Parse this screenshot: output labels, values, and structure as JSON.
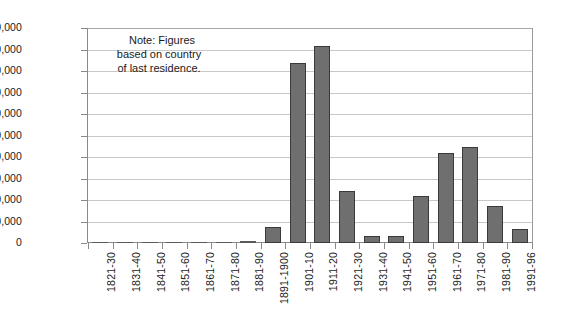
{
  "chart_data": {
    "type": "bar",
    "title": "",
    "subtitle": "",
    "xlabel": "",
    "ylabel": "",
    "ylim": [
      0,
      200000
    ],
    "ytick_step": 20000,
    "grid": true,
    "legend": false,
    "annotations": [
      "Note: Figures",
      "based on country",
      "of last residence."
    ],
    "ytick_labels": [
      "200,000",
      "180,000",
      "160,000",
      "140,000",
      "120,000",
      "100,000",
      "80,000",
      "60,000",
      "40,000",
      "20,000",
      "0"
    ],
    "categories": [
      "1821-30",
      "1831-40",
      "1841-50",
      "1851-60",
      "1861-70",
      "1871-80",
      "1881-90",
      "1891-1900",
      "1901-10",
      "1911-20",
      "1921-30",
      "1931-40",
      "1941-50",
      "1951-60",
      "1961-70",
      "1971-80",
      "1981-90",
      "1991-96"
    ],
    "values": [
      200,
      200,
      200,
      200,
      500,
      800,
      1500,
      14500,
      167000,
      183000,
      48000,
      6500,
      6500,
      43500,
      84000,
      89000,
      34500,
      13000
    ],
    "colors": {
      "bar_fill": "#6f6f6f",
      "bar_border": "#3a3a3a",
      "gridline": "#c8c8c8",
      "axis": "#8a8a8a",
      "text": "#1a1a1a",
      "background": "#ffffff"
    }
  }
}
